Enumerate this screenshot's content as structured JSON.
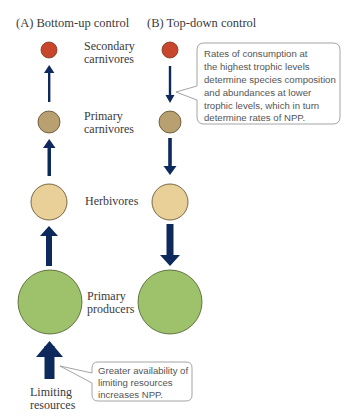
{
  "panels": {
    "a": {
      "title": "(A) Bottom-up control"
    },
    "b": {
      "title": "(B) Top-down control"
    }
  },
  "levels": [
    {
      "label_line1": "Secondary",
      "label_line2": "carnivores",
      "color": "#c8462b"
    },
    {
      "label_line1": "Primary",
      "label_line2": "carnivores",
      "color": "#b9a070"
    },
    {
      "label_line1": "Herbivores",
      "label_line2": "",
      "color": "#e9cf98"
    },
    {
      "label_line1": "Primary",
      "label_line2": "producers",
      "color": "#9dc26b"
    }
  ],
  "limiting": {
    "line1": "Limiting",
    "line2": "resources"
  },
  "callouts": {
    "top_down": {
      "lines": [
        "Rates of consumption at",
        "the highest trophic levels",
        "determine species composition",
        "and abundances at lower",
        "trophic levels, which in turn",
        "determine rates of NPP."
      ]
    },
    "bottom_up": {
      "lines": [
        "Greater availability of",
        "limiting resources",
        "increases NPP."
      ]
    }
  },
  "colors": {
    "arrow": "#0e2a5c",
    "outline": "#5a4a2a",
    "callout_border": "#9a9a9a"
  }
}
